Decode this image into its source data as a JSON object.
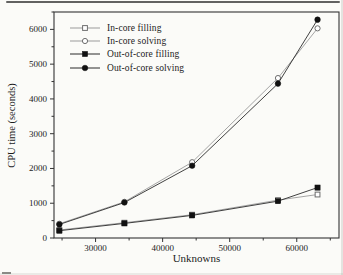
{
  "chart_data": {
    "type": "line",
    "title": "",
    "xlabel": "Unknowns",
    "ylabel": "CPU time (seconds)",
    "xlim": [
      23800,
      66300
    ],
    "ylim": [
      0,
      6500
    ],
    "x_major_ticks": [
      30000,
      40000,
      50000,
      60000
    ],
    "x_minor_ticks": [
      25000,
      35000,
      45000,
      55000,
      65000
    ],
    "y_major_ticks": [
      0,
      1000,
      2000,
      3000,
      4000,
      5000,
      6000
    ],
    "y_minor_ticks": [
      500,
      1500,
      2500,
      3500,
      4500,
      5500,
      6500
    ],
    "grid": false,
    "legend_position": "top-left-inside",
    "x": [
      24600,
      34300,
      44400,
      57200,
      63100
    ],
    "series": [
      {
        "name": "In-core filling",
        "marker": "open-square",
        "line_color": "#9b9b9b",
        "marker_color": "#6e6e6e",
        "values": [
          230,
          440,
          670,
          1090,
          1250
        ]
      },
      {
        "name": "In-core solving",
        "marker": "open-circle",
        "line_color": "#9b9b9b",
        "marker_color": "#6e6e6e",
        "values": [
          410,
          1040,
          2180,
          4600,
          6030
        ]
      },
      {
        "name": "Out-of-core filling",
        "marker": "filled-square",
        "line_color": "#2b2b2b",
        "marker_color": "#111111",
        "values": [
          210,
          420,
          650,
          1060,
          1450
        ]
      },
      {
        "name": "Out-of-core solving",
        "marker": "filled-circle",
        "line_color": "#2b2b2b",
        "marker_color": "#111111",
        "values": [
          390,
          1020,
          2080,
          4440,
          6280
        ]
      }
    ]
  }
}
